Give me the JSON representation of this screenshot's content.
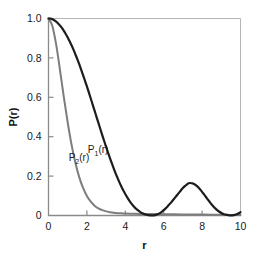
{
  "chart_data": {
    "type": "line",
    "title": "",
    "subtitle": "",
    "xlabel": "r",
    "ylabel": "P(r)",
    "xlim": [
      0,
      10
    ],
    "ylim": [
      0,
      1.0
    ],
    "xticks": [
      0,
      2,
      4,
      6,
      8,
      10
    ],
    "xtick_labels": [
      "0",
      "2",
      "4",
      "6",
      "8",
      "10"
    ],
    "yticks": [
      0,
      0.2,
      0.4,
      0.6,
      0.8,
      1.0
    ],
    "ytick_labels": [
      "0",
      "0.2",
      "0.4",
      "0.6",
      "0.8",
      "1.0"
    ],
    "grid": false,
    "legend": "inline-annotations",
    "annotations": [
      {
        "text": "P₂(r)",
        "base": "P",
        "sub": "2",
        "tail": "(r)",
        "x": 1.05,
        "y": 0.275,
        "series": "P2"
      },
      {
        "text": "P₁(r)",
        "base": "P",
        "sub": "1",
        "tail": "(r)",
        "x": 2.05,
        "y": 0.315,
        "series": "P1"
      }
    ],
    "series": [
      {
        "name": "P1(r)",
        "label": "P₁(r)",
        "color": "#1c1c1c",
        "width": 2.2,
        "x": [
          0.0,
          0.1,
          0.2,
          0.3,
          0.4,
          0.5,
          0.6,
          0.7,
          0.8,
          0.9,
          1.0,
          1.1,
          1.2,
          1.3,
          1.4,
          1.5,
          1.6,
          1.7,
          1.8,
          1.9,
          2.0,
          2.1,
          2.2,
          2.3,
          2.4,
          2.5,
          2.6,
          2.7,
          2.8,
          2.9,
          3.0,
          3.1,
          3.2,
          3.3,
          3.4,
          3.5,
          3.6,
          3.7,
          3.8,
          3.9,
          4.0,
          4.1,
          4.2,
          4.3,
          4.4,
          4.5,
          4.6,
          4.7,
          4.8,
          4.9,
          5.0,
          5.1,
          5.2,
          5.3,
          5.4,
          5.5,
          5.6,
          5.7,
          5.8,
          5.9,
          6.0,
          6.1,
          6.2,
          6.3,
          6.4,
          6.5,
          6.6,
          6.7,
          6.8,
          6.9,
          7.0,
          7.1,
          7.2,
          7.3,
          7.4,
          7.5,
          7.6,
          7.7,
          7.8,
          7.9,
          8.0,
          8.1,
          8.2,
          8.3,
          8.4,
          8.5,
          8.6,
          8.7,
          8.8,
          8.9,
          9.0,
          9.1,
          9.2,
          9.3,
          9.4,
          9.5,
          9.6,
          9.7,
          9.8,
          9.9,
          10.0
        ],
        "y": [
          1.0,
          0.999,
          0.996,
          0.991,
          0.984,
          0.975,
          0.964,
          0.952,
          0.937,
          0.921,
          0.904,
          0.884,
          0.864,
          0.842,
          0.818,
          0.794,
          0.768,
          0.741,
          0.713,
          0.684,
          0.655,
          0.625,
          0.594,
          0.563,
          0.532,
          0.501,
          0.47,
          0.439,
          0.408,
          0.378,
          0.348,
          0.319,
          0.291,
          0.264,
          0.238,
          0.213,
          0.19,
          0.167,
          0.146,
          0.127,
          0.109,
          0.092,
          0.077,
          0.063,
          0.051,
          0.04,
          0.031,
          0.023,
          0.016,
          0.011,
          0.007,
          0.004,
          0.002,
          0.001,
          0.0005,
          0.001,
          0.003,
          0.007,
          0.012,
          0.019,
          0.027,
          0.036,
          0.046,
          0.057,
          0.068,
          0.08,
          0.092,
          0.104,
          0.116,
          0.128,
          0.139,
          0.149,
          0.157,
          0.164,
          0.165,
          0.163,
          0.159,
          0.152,
          0.143,
          0.132,
          0.12,
          0.107,
          0.094,
          0.081,
          0.068,
          0.056,
          0.045,
          0.035,
          0.026,
          0.019,
          0.013,
          0.008,
          0.005,
          0.003,
          0.001,
          0.0005,
          0.001,
          0.003,
          0.006,
          0.011,
          0.017
        ],
        "description": "Oscillating decaying form factor; first lobe falls from 1.0 to ~0 at r=2.3, secondary maxima at r=3.9 (0.165), r=7.0 (0.09), rising tail to 0.06 at r=10"
      },
      {
        "name": "P2(r)",
        "label": "P₂(r)",
        "color": "#7d7d7d",
        "width": 2.0,
        "x": [
          0.0,
          0.2,
          0.4,
          0.6,
          0.8,
          1.0,
          1.2,
          1.4,
          1.6,
          1.8,
          2.0,
          2.2,
          2.4,
          2.6,
          2.8,
          3.0,
          3.2,
          3.4,
          3.6,
          3.8,
          4.0,
          4.4,
          4.8,
          5.2,
          5.6,
          6.0,
          6.5,
          7.0,
          7.5,
          8.0,
          8.5,
          9.0,
          9.5,
          10.0
        ],
        "y": [
          1.0,
          0.962,
          0.867,
          0.737,
          0.6,
          0.472,
          0.36,
          0.268,
          0.195,
          0.14,
          0.099,
          0.07,
          0.05,
          0.036,
          0.027,
          0.021,
          0.017,
          0.014,
          0.012,
          0.011,
          0.01,
          0.009,
          0.008,
          0.0075,
          0.007,
          0.0065,
          0.006,
          0.0055,
          0.005,
          0.0045,
          0.004,
          0.0035,
          0.003,
          0.0025
        ],
        "description": "Smooth monotonic Gaussian-like decay from 1.0 at r=0 to near 0, crossing P1 near r=1.1, flat tail just above zero"
      }
    ],
    "key_points": {
      "P1_first_zero_r": 2.35,
      "P1_peak1": {
        "r": 3.9,
        "value": 0.165
      },
      "P1_peak2": {
        "r": 7.0,
        "value": 0.09
      },
      "P1_value_at_10": 0.06,
      "P2_half_max_r": 1.02,
      "crossover_r": 1.1
    },
    "colors": {
      "P1": "#1c1c1c",
      "P2": "#7d7d7d",
      "axis": "#8a8a8a",
      "text": "#1a1a1a",
      "background": "#ffffff"
    }
  }
}
